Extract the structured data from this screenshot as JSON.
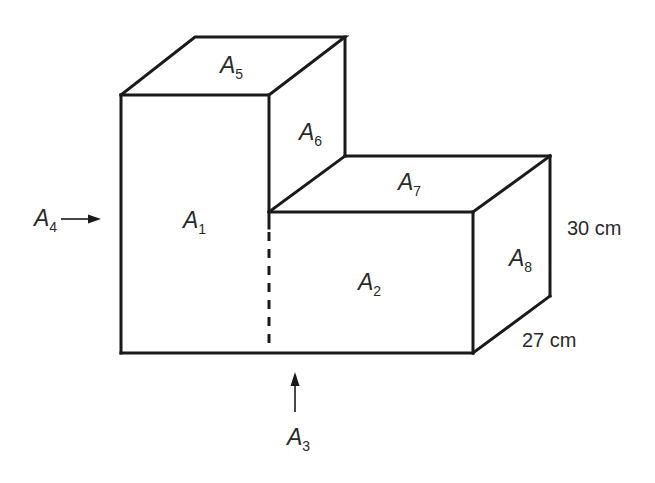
{
  "figure": {
    "type": "3D L-shaped composite solid (two rectangular prisms)",
    "stroke_color": "#1a1a1a",
    "text_color": "#2a2a2a",
    "background": "#ffffff"
  },
  "faces": {
    "A1": {
      "main": "A",
      "sub": "1",
      "description": "front face of tall block"
    },
    "A2": {
      "main": "A",
      "sub": "2",
      "description": "front face of short block"
    },
    "A3": {
      "main": "A",
      "sub": "3",
      "description": "bottom face (indicated by upward arrow)"
    },
    "A4": {
      "main": "A",
      "sub": "4",
      "description": "left side face (indicated by rightward arrow)"
    },
    "A5": {
      "main": "A",
      "sub": "5",
      "description": "top face of tall block"
    },
    "A6": {
      "main": "A",
      "sub": "6",
      "description": "right face of tall block above step"
    },
    "A7": {
      "main": "A",
      "sub": "7",
      "description": "top face of short block"
    },
    "A8": {
      "main": "A",
      "sub": "8",
      "description": "right face of short block"
    }
  },
  "dimensions": {
    "height": "30 cm",
    "depth": "27 cm"
  }
}
